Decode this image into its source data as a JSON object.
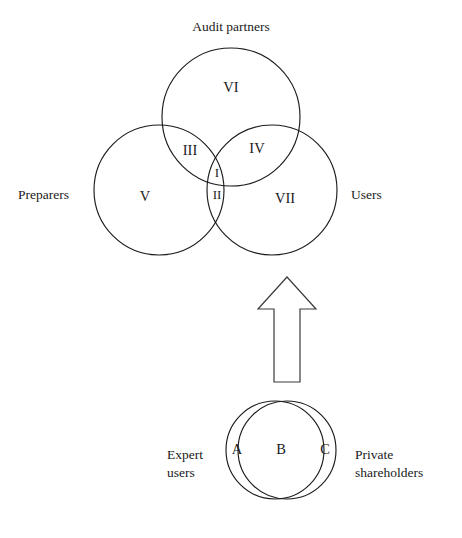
{
  "figure": {
    "type": "venn-diagram",
    "background_color": "#ffffff",
    "stroke_color": "#1b1b1b"
  },
  "top_venn": {
    "sets": [
      {
        "key": "audit_partners",
        "label": "Audit partners",
        "position": "top"
      },
      {
        "key": "preparers",
        "label": "Preparers",
        "position": "left"
      },
      {
        "key": "users",
        "label": "Users",
        "position": "right"
      }
    ],
    "regions": [
      {
        "key": "region-i",
        "label": "I",
        "meaning": "preparers ∩ audit partners ∩ users"
      },
      {
        "key": "region-ii",
        "label": "II",
        "meaning": "preparers ∩ users"
      },
      {
        "key": "region-iii",
        "label": "III",
        "meaning": "preparers ∩ audit partners"
      },
      {
        "key": "region-iv",
        "label": "IV",
        "meaning": "audit partners ∩ users"
      },
      {
        "key": "region-v",
        "label": "V",
        "meaning": "preparers only"
      },
      {
        "key": "region-vi",
        "label": "VI",
        "meaning": "audit partners only"
      },
      {
        "key": "region-vii",
        "label": "VII",
        "meaning": "users only"
      }
    ]
  },
  "arrow": {
    "name": "up-arrow",
    "direction": "up"
  },
  "bottom_venn": {
    "sets": [
      {
        "key": "expert_users",
        "label": "Expert\nusers",
        "position": "left"
      },
      {
        "key": "private_shareholders",
        "label": "Private\nshareholders",
        "position": "right"
      }
    ],
    "regions": [
      {
        "key": "region-a",
        "label": "A",
        "meaning": "expert users only"
      },
      {
        "key": "region-b",
        "label": "B",
        "meaning": "expert users ∩ private shareholders"
      },
      {
        "key": "region-c",
        "label": "C",
        "meaning": "private shareholders only"
      }
    ]
  }
}
